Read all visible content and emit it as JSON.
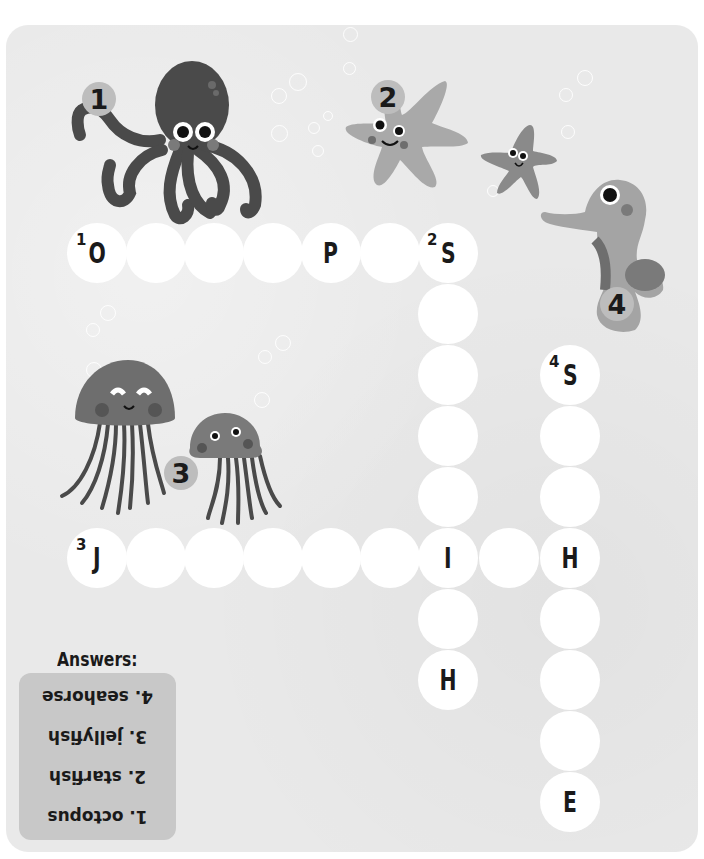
{
  "puzzle": {
    "type": "crossword",
    "theme": "sea creatures",
    "clue_badges": [
      {
        "number": "1",
        "creature": "octopus"
      },
      {
        "number": "2",
        "creature": "starfish"
      },
      {
        "number": "3",
        "creature": "jellyfish"
      },
      {
        "number": "4",
        "creature": "seahorse"
      }
    ],
    "words": [
      {
        "number": "1",
        "direction": "across",
        "answer": "OCTOPUS",
        "cells": [
          "O",
          "",
          "",
          "",
          "P",
          "",
          "S"
        ]
      },
      {
        "number": "2",
        "direction": "down",
        "answer": "STARFISH",
        "cells": [
          "S",
          "",
          "",
          "",
          "",
          "I",
          "",
          "H"
        ]
      },
      {
        "number": "3",
        "direction": "across",
        "answer": "JELLYFISH",
        "cells": [
          "J",
          "",
          "",
          "",
          "",
          "",
          "I",
          "",
          "H"
        ]
      },
      {
        "number": "4",
        "direction": "down",
        "answer": "SEAHORSE",
        "cells": [
          "S",
          "",
          "",
          "H",
          "",
          "",
          "",
          "E"
        ]
      }
    ],
    "grid": {
      "row1": [
        {
          "n": "1",
          "l": "O"
        },
        {
          "n": "",
          "l": ""
        },
        {
          "n": "",
          "l": ""
        },
        {
          "n": "",
          "l": ""
        },
        {
          "n": "",
          "l": "P"
        },
        {
          "n": "",
          "l": ""
        },
        {
          "n": "2",
          "l": "S"
        }
      ],
      "col2": [
        {
          "l": ""
        },
        {
          "l": ""
        },
        {
          "l": ""
        },
        {
          "l": ""
        },
        {
          "l": "I"
        },
        {
          "l": ""
        },
        {
          "l": "H"
        }
      ],
      "row3": [
        {
          "n": "3",
          "l": "J"
        },
        {
          "l": ""
        },
        {
          "l": ""
        },
        {
          "l": ""
        },
        {
          "l": ""
        },
        {
          "l": ""
        },
        {
          "l": ""
        },
        {
          "l": "H"
        }
      ],
      "col4": [
        {
          "n": "4",
          "l": "S"
        },
        {
          "l": ""
        },
        {
          "l": ""
        },
        {
          "l": ""
        },
        {
          "l": ""
        },
        {
          "l": ""
        },
        {
          "l": ""
        },
        {
          "l": "E"
        }
      ]
    }
  },
  "answers": {
    "title": "Answers:",
    "items": [
      "1. octopus",
      "2. starfish",
      "3. jellyfish",
      "4. seahorse"
    ]
  },
  "colors": {
    "background": "#e9e9e9",
    "cell": "#ffffff",
    "badge": "#bdbdbd",
    "answers_box": "#c8c8c8",
    "octopus": "#4a4a4a",
    "starfish_big": "#a9a9a9",
    "starfish_small": "#8a8a8a",
    "jellyfish": "#6e6e6e",
    "seahorse": "#a4a4a4"
  }
}
